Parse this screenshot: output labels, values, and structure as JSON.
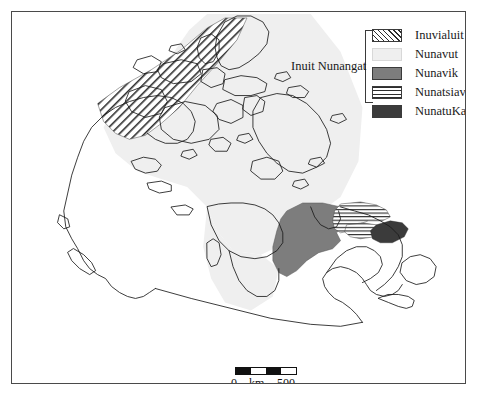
{
  "figure": {
    "name": "map-of-inuit-nunangat-canada",
    "background_color": "#ffffff",
    "frame_color": "#4a4a4a"
  },
  "legend": {
    "group_label": "Inuit Nunangat",
    "entries": [
      {
        "label": "Inuvialuit",
        "pattern": "diagonal-hatch",
        "color": "#2e2e2e"
      },
      {
        "label": "Nunavut",
        "pattern": "solid",
        "color": "#efefef"
      },
      {
        "label": "Nunavik",
        "pattern": "solid",
        "color": "#7d7d7d"
      },
      {
        "label": "Nunatsiavut",
        "pattern": "horizontal-lines",
        "color": "#2e2e2e"
      },
      {
        "label": "NunatuKavut",
        "pattern": "solid",
        "color": "#3b3b3b"
      }
    ]
  },
  "scalebar": {
    "zero_label": "0",
    "unit_label": "km",
    "max_label": "500",
    "segments": [
      "dark",
      "light",
      "dark",
      "light"
    ]
  },
  "caption": {
    "text": ""
  },
  "map": {
    "coastline_color": "#1a1a1a",
    "regions": [
      {
        "name": "Inuvialuit",
        "fill": "diagonal-hatch"
      },
      {
        "name": "Nunavut",
        "fill": "#efefef"
      },
      {
        "name": "Nunavik",
        "fill": "#7d7d7d"
      },
      {
        "name": "Nunatsiavut",
        "fill": "horizontal-lines"
      },
      {
        "name": "NunatuKavut",
        "fill": "#3b3b3b"
      }
    ]
  }
}
